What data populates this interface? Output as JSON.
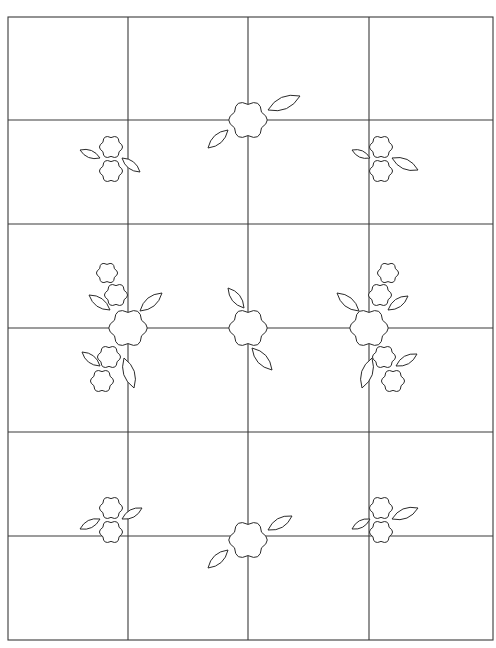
{
  "diagram": {
    "type": "quilt-block-pattern",
    "caption_fragment": "",
    "colors": {
      "line": "#3a3a3a",
      "motif_stroke": "#2a2a2a",
      "background": "#ffffff"
    },
    "grid": {
      "left": 8,
      "top": 17,
      "right": 493,
      "bottom": 640,
      "columns_x": [
        8,
        128,
        248,
        369,
        493
      ],
      "rows_y": [
        17,
        120,
        224,
        328,
        432,
        536,
        640
      ]
    },
    "motifs": [
      {
        "name": "top-center-flower",
        "kind": "single",
        "cx": 248,
        "cy": 120,
        "r": 20,
        "leaves": [
          {
            "x1": 268,
            "y1": 110,
            "x2": 300,
            "y2": 96
          },
          {
            "x1": 228,
            "y1": 130,
            "x2": 208,
            "y2": 148
          }
        ]
      },
      {
        "name": "top-left-pair",
        "kind": "pair",
        "flowers": [
          {
            "cx": 111,
            "cy": 147,
            "r": 12
          },
          {
            "cx": 111,
            "cy": 171,
            "r": 12
          }
        ],
        "leaves": [
          {
            "x1": 100,
            "y1": 158,
            "x2": 80,
            "y2": 150
          },
          {
            "x1": 122,
            "y1": 158,
            "x2": 140,
            "y2": 172
          }
        ]
      },
      {
        "name": "top-right-pair",
        "kind": "pair",
        "flowers": [
          {
            "cx": 381,
            "cy": 147,
            "r": 12
          },
          {
            "cx": 381,
            "cy": 171,
            "r": 12
          }
        ],
        "leaves": [
          {
            "x1": 370,
            "y1": 158,
            "x2": 352,
            "y2": 150
          },
          {
            "x1": 392,
            "y1": 158,
            "x2": 418,
            "y2": 170
          }
        ]
      },
      {
        "name": "middle-left-cluster",
        "kind": "cluster",
        "flowers": [
          {
            "cx": 107,
            "cy": 273,
            "r": 11
          },
          {
            "cx": 116,
            "cy": 295,
            "r": 12
          },
          {
            "cx": 128,
            "cy": 328,
            "r": 20
          },
          {
            "cx": 109,
            "cy": 357,
            "r": 12
          },
          {
            "cx": 102,
            "cy": 381,
            "r": 12
          }
        ],
        "leaves": [
          {
            "x1": 110,
            "y1": 310,
            "x2": 89,
            "y2": 295
          },
          {
            "x1": 140,
            "y1": 311,
            "x2": 162,
            "y2": 293
          },
          {
            "x1": 100,
            "y1": 366,
            "x2": 82,
            "y2": 352
          },
          {
            "x1": 124,
            "y1": 358,
            "x2": 134,
            "y2": 388
          }
        ]
      },
      {
        "name": "middle-center-flower",
        "kind": "single",
        "cx": 248,
        "cy": 328,
        "r": 20,
        "leaves": [
          {
            "x1": 244,
            "y1": 308,
            "x2": 228,
            "y2": 288
          },
          {
            "x1": 252,
            "y1": 348,
            "x2": 272,
            "y2": 370
          }
        ]
      },
      {
        "name": "middle-right-cluster",
        "kind": "cluster",
        "flowers": [
          {
            "cx": 388,
            "cy": 273,
            "r": 11
          },
          {
            "cx": 380,
            "cy": 295,
            "r": 12
          },
          {
            "cx": 369,
            "cy": 328,
            "r": 20
          },
          {
            "cx": 384,
            "cy": 357,
            "r": 12
          },
          {
            "cx": 393,
            "cy": 381,
            "r": 12
          }
        ],
        "leaves": [
          {
            "x1": 359,
            "y1": 311,
            "x2": 337,
            "y2": 293
          },
          {
            "x1": 388,
            "y1": 310,
            "x2": 408,
            "y2": 296
          },
          {
            "x1": 372,
            "y1": 358,
            "x2": 362,
            "y2": 388
          },
          {
            "x1": 396,
            "y1": 366,
            "x2": 417,
            "y2": 354
          }
        ]
      },
      {
        "name": "bottom-left-pair",
        "kind": "pair",
        "flowers": [
          {
            "cx": 111,
            "cy": 508,
            "r": 12
          },
          {
            "cx": 111,
            "cy": 532,
            "r": 12
          }
        ],
        "leaves": [
          {
            "x1": 100,
            "y1": 519,
            "x2": 80,
            "y2": 529
          },
          {
            "x1": 122,
            "y1": 519,
            "x2": 142,
            "y2": 508
          }
        ]
      },
      {
        "name": "bottom-center-flower",
        "kind": "single",
        "cx": 248,
        "cy": 540,
        "r": 20,
        "leaves": [
          {
            "x1": 268,
            "y1": 530,
            "x2": 292,
            "y2": 516
          },
          {
            "x1": 228,
            "y1": 550,
            "x2": 208,
            "y2": 568
          }
        ]
      },
      {
        "name": "bottom-right-pair",
        "kind": "pair",
        "flowers": [
          {
            "cx": 381,
            "cy": 508,
            "r": 12
          },
          {
            "cx": 381,
            "cy": 532,
            "r": 12
          }
        ],
        "leaves": [
          {
            "x1": 370,
            "y1": 519,
            "x2": 352,
            "y2": 529
          },
          {
            "x1": 392,
            "y1": 519,
            "x2": 418,
            "y2": 508
          }
        ]
      }
    ]
  }
}
